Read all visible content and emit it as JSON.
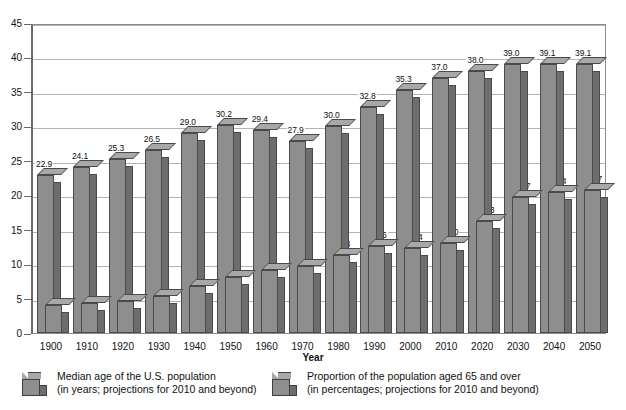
{
  "chart_data": {
    "type": "bar",
    "title": "",
    "xlabel": "Year",
    "ylabel": "",
    "ylim": [
      0,
      45
    ],
    "yticks": [
      0,
      5,
      10,
      15,
      20,
      25,
      30,
      35,
      40,
      45
    ],
    "grid": true,
    "legend_position": "bottom",
    "categories": [
      "1900",
      "1910",
      "1920",
      "1930",
      "1940",
      "1950",
      "1960",
      "1970",
      "1980",
      "1990",
      "2000",
      "2010",
      "2020",
      "2030",
      "2040",
      "2050"
    ],
    "series": [
      {
        "name": "Median age of the U.S. population",
        "unit_note": "(in years; projections for 2010 and beyond)",
        "values": [
          22.9,
          24.1,
          25.3,
          26.5,
          29.0,
          30.2,
          29.4,
          27.9,
          30.0,
          32.8,
          35.3,
          37.0,
          38.0,
          39.0,
          39.1,
          39.1
        ]
      },
      {
        "name": "Proportion of the population aged 65 and over",
        "unit_note": "(in percentages; projections for 2010 and beyond)",
        "values": [
          4.1,
          4.3,
          4.6,
          5.4,
          6.8,
          8.1,
          9.2,
          9.8,
          11.3,
          12.6,
          12.4,
          13.0,
          16.3,
          19.7,
          20.4,
          20.7
        ]
      }
    ]
  },
  "legend": {
    "items": [
      {
        "line1": "Median age of the U.S. population",
        "line2": "(in years; projections for 2010 and beyond)",
        "swatch": "gray-cube-swatch"
      },
      {
        "line1": "Proportion of the population aged 65 and over",
        "line2": "(in percentages; projections for 2010 and beyond)",
        "swatch": "gray-cube-swatch"
      }
    ]
  },
  "axis": {
    "x_title": "Year"
  },
  "colors": {
    "bar_face": "#8e8e8e",
    "bar_side": "#6d6d6d",
    "bar_top": "#a8a8a8",
    "bar_edge": "#4a4a4a",
    "gridline": "#b3b3b3",
    "frame": "#8c8c8c",
    "background": "#ffffff"
  }
}
